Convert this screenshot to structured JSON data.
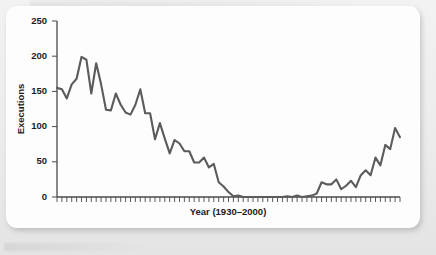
{
  "chart_data": {
    "type": "line",
    "title": "",
    "xlabel": "Year (1930–2000)",
    "ylabel": "Executions",
    "ylim": [
      0,
      250
    ],
    "xlim": [
      1930,
      2000
    ],
    "yticks": [
      0,
      50,
      100,
      150,
      200,
      250
    ],
    "ytick_labels": [
      "0",
      "50",
      "100",
      "150",
      "200",
      "250"
    ],
    "grid": false,
    "legend": null,
    "line_color": "#5b5b5b",
    "x": [
      1930,
      1931,
      1932,
      1933,
      1934,
      1935,
      1936,
      1937,
      1938,
      1939,
      1940,
      1941,
      1942,
      1943,
      1944,
      1945,
      1946,
      1947,
      1948,
      1949,
      1950,
      1951,
      1952,
      1953,
      1954,
      1955,
      1956,
      1957,
      1958,
      1959,
      1960,
      1961,
      1962,
      1963,
      1964,
      1965,
      1966,
      1967,
      1968,
      1969,
      1970,
      1971,
      1972,
      1973,
      1974,
      1975,
      1976,
      1977,
      1978,
      1979,
      1980,
      1981,
      1982,
      1983,
      1984,
      1985,
      1986,
      1987,
      1988,
      1989,
      1990,
      1991,
      1992,
      1993,
      1994,
      1995,
      1996,
      1997,
      1998,
      1999,
      2000
    ],
    "values": [
      155,
      153,
      140,
      160,
      168,
      199,
      195,
      147,
      190,
      160,
      124,
      123,
      147,
      131,
      120,
      117,
      131,
      153,
      119,
      119,
      82,
      105,
      83,
      62,
      81,
      76,
      65,
      65,
      49,
      49,
      56,
      42,
      47,
      21,
      15,
      7,
      1,
      2,
      0,
      0,
      0,
      0,
      0,
      0,
      0,
      0,
      0,
      1,
      0,
      2,
      0,
      1,
      2,
      5,
      21,
      18,
      18,
      25,
      11,
      16,
      23,
      14,
      31,
      38,
      31,
      56,
      45,
      74,
      68,
      98,
      85
    ],
    "series_name": "Executions"
  },
  "axis": {
    "y_label": "Executions",
    "x_label": "Year (1930–2000)"
  }
}
